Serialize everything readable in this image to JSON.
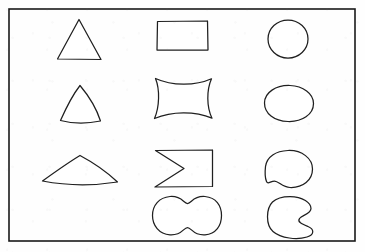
{
  "figure": {
    "width": 365,
    "height": 252,
    "background_color": "#fefefe",
    "stroke_color": "#1f1f1f",
    "frame": {
      "name": "outer-border",
      "x": 9,
      "y": 9,
      "width": 346,
      "height": 232,
      "stroke_color": "#1a1a1a",
      "stroke_width": 1.6
    }
  },
  "columns": [
    {
      "index": 1,
      "label": "Column 1 - triangular family",
      "shape_count": 3
    },
    {
      "index": 2,
      "label": "Column 2 - quadrilateral family",
      "shape_count": 4
    },
    {
      "index": 3,
      "label": "Column 3 - round family",
      "shape_count": 4
    }
  ],
  "shapes": [
    {
      "id": "triangle",
      "name": "Triangle",
      "column": 1,
      "row": 1,
      "bbox": {
        "x": 57,
        "y": 19,
        "width": 44,
        "height": 41
      },
      "path": "M 79.0 19.5 L 101.0 59.5 L 57.5 59.0 Z"
    },
    {
      "id": "curved-triangle",
      "name": "Curved triangle",
      "column": 1,
      "row": 2,
      "bbox": {
        "x": 60,
        "y": 85,
        "width": 41,
        "height": 38
      },
      "path": "M 80.0 85.5 C 88.0 95.0 96.0 107.0 100.5 121.0 C 87.0 123.8 72.0 123.5 60.5 120.5 C 66.5 107.0 73.0 94.5 80.0 85.5 Z"
    },
    {
      "id": "fan-sector",
      "name": "Fan sector",
      "column": 1,
      "row": 3,
      "bbox": {
        "x": 42,
        "y": 155,
        "width": 76,
        "height": 30
      },
      "path": "M 80.0 155.5 C 95.0 163.5 108.0 173.0 117.5 182.0 C 92.0 186.0 66.0 185.5 42.5 181.0 C 55.0 172.0 67.5 163.0 80.0 155.5 Z"
    },
    {
      "id": "rectangle",
      "name": "Rectangle",
      "column": 2,
      "row": 1,
      "bbox": {
        "x": 157,
        "y": 21,
        "width": 51,
        "height": 29
      },
      "path": "M 157.5 21.5 L 207.5 21.0 L 208.0 50.0 L 157.0 50.0 Z"
    },
    {
      "id": "cushion",
      "name": "Concave cushion",
      "column": 2,
      "row": 2,
      "bbox": {
        "x": 152,
        "y": 78,
        "width": 62,
        "height": 41
      },
      "path": "M 155.5 78.5 C 172.0 86.0 195.0 86.2 211.5 78.8 C 206.5 90.0 206.5 107.0 212.0 118.2 C 195.0 111.0 172.0 111.0 154.5 118.5 C 159.5 107.0 160.0 89.5 155.5 78.5 Z"
    },
    {
      "id": "bowtie",
      "name": "Bowtie",
      "column": 2,
      "row": 3,
      "bbox": {
        "x": 155,
        "y": 150,
        "width": 58,
        "height": 37
      },
      "path": "M 155.5 150.5 L 212.5 150.0 L 212.5 186.5 L 155.0 187.0 L 184.0 168.5 Z"
    },
    {
      "id": "peanut",
      "name": "Peanut",
      "column": 2,
      "row": 4,
      "bbox": {
        "x": 152,
        "y": 196,
        "width": 70,
        "height": 39
      },
      "path": "M 170.0 196.5 C 182.0 195.5 183.5 203.5 187.5 203.5 C 191.5 203.5 193.0 195.5 205.0 196.5 C 216.0 197.5 221.5 205.5 221.5 215.5 C 221.5 225.5 216.0 234.0 205.0 234.8 C 193.0 235.6 191.5 227.5 187.5 227.5 C 183.5 227.5 182.0 235.6 170.0 234.8 C 159.0 234.0 152.5 225.5 152.5 215.5 C 152.5 205.5 159.0 197.5 170.0 196.5 Z"
    },
    {
      "id": "circle",
      "name": "Circle",
      "column": 3,
      "row": 1,
      "bbox": {
        "x": 268,
        "y": 20,
        "width": 40,
        "height": 38
      },
      "path": "M 288.0 20.0 C 299.0 20.0 308.0 28.5 308.0 39.0 C 308.0 49.5 299.0 58.0 288.0 58.0 C 277.0 58.0 268.0 49.5 268.0 39.0 C 268.0 28.5 277.0 20.0 288.0 20.0 Z"
    },
    {
      "id": "oval",
      "name": "Oval",
      "column": 3,
      "row": 2,
      "bbox": {
        "x": 264,
        "y": 85,
        "width": 50,
        "height": 37
      },
      "path": "M 290.0 85.5 C 303.0 86.0 313.5 93.5 313.5 103.5 C 313.5 114.5 302.0 122.0 288.0 121.5 C 274.0 121.0 264.5 113.5 264.5 103.0 C 264.5 92.5 276.0 85.0 290.0 85.5 Z"
    },
    {
      "id": "bean",
      "name": "Bean",
      "column": 3,
      "row": 3,
      "bbox": {
        "x": 265,
        "y": 150,
        "width": 48,
        "height": 38
      },
      "path": "M 288.0 150.5 C 302.0 150.0 312.5 158.5 312.5 169.0 C 312.5 180.0 303.0 188.0 290.0 187.5 C 282.5 187.2 278.5 181.0 274.5 181.0 C 270.5 181.0 268.0 185.0 266.5 181.5 C 264.8 177.5 265.0 171.0 265.5 166.5 C 266.8 156.5 276.0 151.0 288.0 150.5 Z"
    },
    {
      "id": "bitten-disk",
      "name": "Bitten disk",
      "column": 3,
      "row": 4,
      "bbox": {
        "x": 266,
        "y": 196,
        "width": 49,
        "height": 42
      },
      "path": "M 290.0 196.5 C 303.0 196.5 311.0 203.0 311.0 208.5 C 311.0 214.0 302.0 215.0 299.5 218.5 C 297.0 222.0 302.0 224.0 308.0 226.5 C 314.0 229.0 315.0 234.5 307.0 237.0 C 297.0 240.0 281.0 238.5 273.0 231.5 C 265.5 225.0 266.0 208.5 272.5 202.0 C 276.5 198.0 283.0 196.5 290.0 196.5 Z"
    }
  ]
}
